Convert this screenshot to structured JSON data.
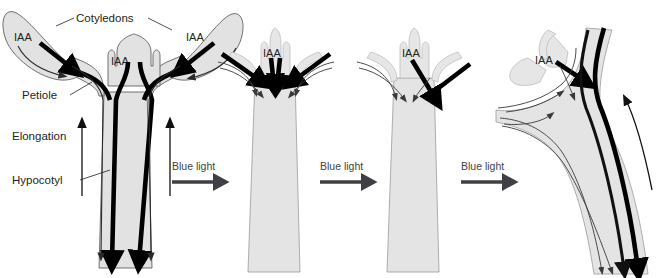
{
  "figure": {
    "background_color": "#ffffff",
    "organ_fill_color": "#e2e2e2",
    "organ_outline_color": "#58585b",
    "flow_color": "#000000",
    "label_color": "#231f20",
    "blue_light_label_color": "#3f3f45"
  },
  "annotations": {
    "cotyledons": "Cotyledons",
    "petiole": "Petiole",
    "elongation": "Elongation",
    "hypocotyl": "Hypocotyl"
  },
  "hormone": {
    "abbrev": "IAA"
  },
  "stimulus": {
    "label": "Blue light",
    "arrow_direction": "right"
  },
  "panels": [
    {
      "id": "panel-1",
      "index": 1,
      "stage": "dark-grown upright seedling",
      "iaa_labels": [
        "IAA",
        "IAA",
        "IAA"
      ],
      "annotated": true,
      "annotation_labels": [
        "Cotyledons",
        "Petiole",
        "Elongation",
        "Hypocotyl"
      ],
      "elongation_arrows": 2,
      "basipetal_arrows": 4,
      "symmetry": "symmetric"
    },
    {
      "id": "panel-2",
      "index": 2,
      "stage": "early blue light response, cotyledons droop",
      "iaa_labels": [
        "IAA"
      ],
      "annotated": false,
      "elongation_arrows": 0,
      "symmetry": "symmetric"
    },
    {
      "id": "panel-3",
      "index": 3,
      "stage": "lateral IAA redistribution toward shaded side",
      "iaa_labels": [
        "IAA"
      ],
      "annotated": false,
      "elongation_arrows": 0,
      "symmetry": "asymmetric"
    },
    {
      "id": "panel-4",
      "index": 4,
      "stage": "phototropic curvature toward light",
      "iaa_labels": [
        "IAA"
      ],
      "annotated": false,
      "elongation_arrows": 1,
      "symmetry": "bent toward light"
    }
  ],
  "stimulus_arrows": [
    {
      "id": "blue-light-1",
      "label": "Blue light",
      "between_panels": "1-2"
    },
    {
      "id": "blue-light-2",
      "label": "Blue light",
      "between_panels": "2-3"
    },
    {
      "id": "blue-light-3",
      "label": "Blue light",
      "between_panels": "3-4"
    }
  ]
}
